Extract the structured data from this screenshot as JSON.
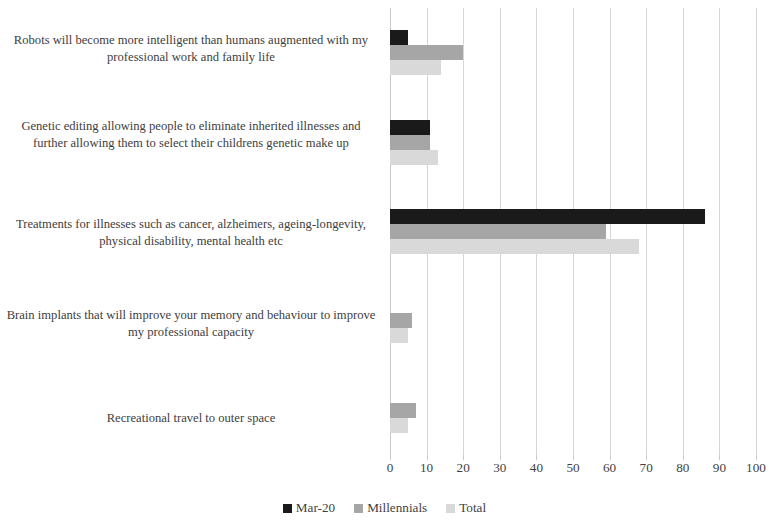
{
  "chart_data": {
    "type": "bar",
    "orientation": "horizontal",
    "title": "",
    "xlabel": "",
    "ylabel": "",
    "xlim": [
      0,
      100
    ],
    "xticks": [
      "0",
      "10",
      "20",
      "30",
      "40",
      "50",
      "60",
      "70",
      "80",
      "90",
      "100"
    ],
    "grid": true,
    "legend_position": "bottom",
    "categories": [
      "Robots will become more intelligent than humans augmented with my professional work and family life",
      "Genetic editing allowing people to eliminate inherited illnesses and further allowing them to select their childrens genetic make up",
      "Treatments for illnesses such as cancer, alzheimers, ageing-longevity, physical disability, mental health etc",
      "Brain implants that will improve your memory and behaviour to improve my professional capacity",
      "Recreational travel to outer space"
    ],
    "series": [
      {
        "name": "Mar-20",
        "color": "#1a1a1a",
        "values": [
          5,
          11,
          86,
          0,
          0
        ]
      },
      {
        "name": "Millennials",
        "color": "#a6a6a6",
        "values": [
          20,
          11,
          59,
          6,
          7
        ]
      },
      {
        "name": "Total",
        "color": "#d9d9d9",
        "values": [
          14,
          13,
          68,
          5,
          5
        ]
      }
    ]
  },
  "axis": {
    "grid_color": "#d6d6d6",
    "line_color": "#c8c8c8"
  }
}
